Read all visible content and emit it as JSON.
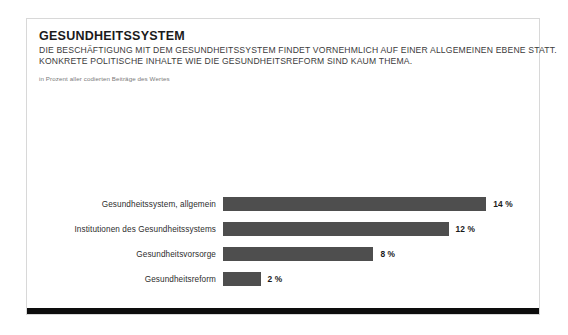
{
  "card": {
    "title": "GESUNDHEITSSYSTEM",
    "subtitle_line_1": "DIE BESCHÄFTIGUNG MIT DEM GESUNDHEITSSYSTEM FINDET VORNEHMLICH AUF EINER ALLGEMEINEN EBENE STATT.",
    "subtitle_line_2": "KONKRETE POLITISCHE INHALTE WIE DIE GESUNDHEITSREFORM SIND KAUM THEMA.",
    "source_note": "in Prozent aller codierten Beiträge des Wertes"
  },
  "colors": {
    "bar_fill": "#4e4e4e",
    "footer_bar": "#0d0d0d",
    "card_border": "#d8d8d8",
    "title_text": "#1b1b1b",
    "label_text": "#2d2d2d",
    "note_text": "#7a7a7a",
    "background": "#ffffff"
  },
  "chart_data": {
    "type": "bar",
    "orientation": "horizontal",
    "title": "GESUNDHEITSSYSTEM",
    "subtitle": "DIE BESCHÄFTIGUNG MIT DEM GESUNDHEITSSYSTEM FINDET VORNEHMLICH AUF EINER ALLGEMEINEN EBENE STATT. KONKRETE POLITISCHE INHALTE WIE DIE GESUNDHEITSREFORM SIND KAUM THEMA.",
    "xlabel": "",
    "ylabel": "",
    "unit": "%",
    "axis_note": "in Prozent aller codierten Beiträge des Wertes",
    "xlim": [
      0,
      16
    ],
    "grid": false,
    "legend": false,
    "categories": [
      "Gesundheitssystem, allgemein",
      "Institutionen des Gesundheitssystems",
      "Gesundheitsvorsorge",
      "Gesundheitsreform"
    ],
    "values": [
      14,
      12,
      8,
      2
    ],
    "value_labels": [
      "14 %",
      "12 %",
      "8 %",
      "2 %"
    ],
    "bars": [
      {
        "category": "Gesundheitssystem, allgemein",
        "value": 14,
        "value_label": "14 %"
      },
      {
        "category": "Institutionen des Gesundheitssystems",
        "value": 12,
        "value_label": "12 %"
      },
      {
        "category": "Gesundheitsvorsorge",
        "value": 8,
        "value_label": "8 %"
      },
      {
        "category": "Gesundheitsreform",
        "value": 2,
        "value_label": "2 %"
      }
    ]
  }
}
